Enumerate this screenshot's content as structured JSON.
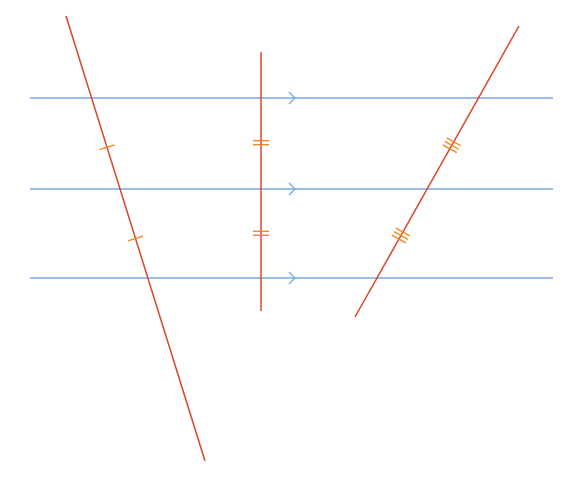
{
  "diagram": {
    "title": "",
    "colors": {
      "background": "#ffffff",
      "parallel_line": "#7aa7dc",
      "transversal": "#d9452b",
      "tick_mark": "#f08a1c"
    },
    "parallel_lines": [
      {
        "id": "p1",
        "y": 98,
        "x1": 30,
        "x2": 553,
        "arrow_x": 293
      },
      {
        "id": "p2",
        "y": 189,
        "x1": 30,
        "x2": 553,
        "arrow_x": 293
      },
      {
        "id": "p3",
        "y": 278,
        "x1": 30,
        "x2": 553,
        "arrow_x": 293
      }
    ],
    "transversals": [
      {
        "id": "t1",
        "x1": 66,
        "y1": 16,
        "x2": 205,
        "y2": 461,
        "tick_count": 1,
        "ticks_at": [
          0.295,
          0.5
        ]
      },
      {
        "id": "t2",
        "x1": 261,
        "y1": 52,
        "x2": 261,
        "y2": 311,
        "tick_count": 2,
        "ticks_at": [
          0.35,
          0.7
        ]
      },
      {
        "id": "t3",
        "x1": 519,
        "y1": 26,
        "x2": 355,
        "y2": 317,
        "tick_count": 3,
        "ticks_at": [
          0.41,
          0.72
        ]
      }
    ]
  }
}
